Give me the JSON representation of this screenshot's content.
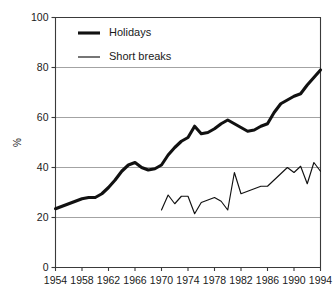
{
  "chart_data": {
    "type": "line",
    "title": "",
    "subtitle": "",
    "xlabel": "",
    "ylabel": "%",
    "xlim": [
      1954,
      1994
    ],
    "ylim": [
      0,
      100
    ],
    "grid": true,
    "grid_values": [
      20,
      40,
      60,
      80
    ],
    "legend_position": "top-left",
    "y_ticks": [
      0,
      20,
      40,
      60,
      80,
      100
    ],
    "y_tick_labels": [
      "0",
      "20",
      "40",
      "60",
      "80",
      "100"
    ],
    "x_ticks": [
      1954,
      1958,
      1962,
      1966,
      1970,
      1974,
      1978,
      1982,
      1986,
      1990,
      1994
    ],
    "x_tick_labels": [
      "1954",
      "1958",
      "1962",
      "1966",
      "1970",
      "1974",
      "1978",
      "1982",
      "1986",
      "1990",
      "1994"
    ],
    "series": [
      {
        "name": "Holidays",
        "style": "thick",
        "color": "#111111",
        "x": [
          1954,
          1955,
          1956,
          1957,
          1958,
          1959,
          1960,
          1961,
          1962,
          1963,
          1964,
          1965,
          1966,
          1967,
          1968,
          1969,
          1970,
          1971,
          1972,
          1973,
          1974,
          1975,
          1976,
          1977,
          1978,
          1979,
          1980,
          1981,
          1982,
          1983,
          1984,
          1985,
          1986,
          1987,
          1988,
          1989,
          1990,
          1991,
          1992,
          1993,
          1994
        ],
        "values": [
          23.5,
          24.5,
          25.5,
          26.5,
          27.5,
          28.0,
          28.0,
          29.5,
          32.0,
          35.0,
          38.5,
          41.0,
          42.0,
          40.0,
          39.0,
          39.5,
          41.0,
          45.0,
          48.0,
          50.5,
          52.0,
          56.5,
          53.5,
          54.0,
          55.5,
          57.5,
          59.0,
          57.5,
          56.0,
          54.5,
          55.0,
          56.5,
          57.5,
          62.0,
          65.5,
          67.0,
          68.5,
          69.5,
          73.0,
          76.0,
          79.0
        ]
      },
      {
        "name": "Short breaks",
        "style": "thin",
        "color": "#111111",
        "x": [
          1970,
          1971,
          1972,
          1973,
          1974,
          1975,
          1976,
          1977,
          1978,
          1979,
          1980,
          1981,
          1982,
          1983,
          1984,
          1985,
          1986,
          1987,
          1988,
          1989,
          1990,
          1991,
          1992,
          1993,
          1994
        ],
        "values": [
          23.0,
          29.0,
          25.5,
          28.5,
          28.5,
          21.5,
          26.0,
          27.0,
          28.0,
          26.5,
          23.0,
          38.0,
          29.5,
          30.5,
          31.5,
          32.5,
          32.5,
          35.0,
          37.5,
          40.0,
          38.0,
          40.5,
          33.5,
          42.0,
          38.5
        ]
      }
    ]
  },
  "legend": {
    "items": [
      {
        "label": "Holidays"
      },
      {
        "label": "Short breaks"
      }
    ]
  }
}
